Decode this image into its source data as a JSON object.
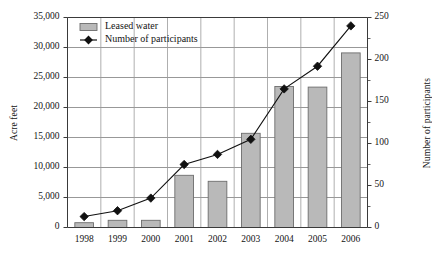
{
  "chart_data": {
    "type": "bar",
    "title": "",
    "subtitle": "",
    "categories": [
      "1998",
      "1999",
      "2000",
      "2001",
      "2002",
      "2003",
      "2004",
      "2005",
      "2006"
    ],
    "xlabel": "",
    "ylabel": "Acre feet",
    "ylabel_secondary": "Number of participants",
    "ylim": [
      0,
      35000
    ],
    "ylim_secondary": [
      0,
      250
    ],
    "yticks": [
      "0",
      "5,000",
      "10,000",
      "15,000",
      "20,000",
      "25,000",
      "30,000",
      "35,000"
    ],
    "ytick_values": [
      0,
      5000,
      10000,
      15000,
      20000,
      25000,
      30000,
      35000
    ],
    "yticks_secondary": [
      "0",
      "50",
      "100",
      "150",
      "200",
      "250"
    ],
    "ytick_values_secondary": [
      0,
      50,
      100,
      150,
      200,
      250
    ],
    "grid": true,
    "legend_position": "top-left",
    "series": [
      {
        "name": "Leased water",
        "type": "bar",
        "axis": "left",
        "unit": "acre feet",
        "color": "#b9b9b9",
        "edge_color": "#6d6d6d",
        "values": [
          800,
          1200,
          1200,
          8700,
          7700,
          15700,
          23500,
          23400,
          29100
        ]
      },
      {
        "name": "Number of participants",
        "type": "line",
        "axis": "right",
        "unit": "participants",
        "color": "#111111",
        "marker": "diamond",
        "values": [
          13,
          20,
          35,
          75,
          87,
          105,
          165,
          192,
          240
        ]
      }
    ]
  },
  "legend": {
    "items": [
      {
        "label": "Leased water",
        "marker": "bar-swatch"
      },
      {
        "label": "Number of participants",
        "marker": "diamond-line"
      }
    ]
  },
  "axes": {
    "left_title": "Acre feet",
    "right_title": "Number of participants"
  }
}
